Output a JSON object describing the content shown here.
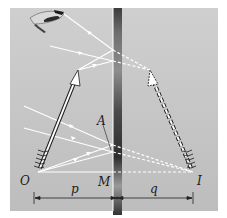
{
  "figure": {
    "labels": {
      "object": "O",
      "image": "I",
      "mirror_point": "M",
      "reflection_point": "A",
      "object_distance": "p",
      "image_distance": "q"
    },
    "colors": {
      "background": "#c3c3c3",
      "mirror_dark": "#3a3a3a",
      "ray": "#ffffff",
      "text": "#1a1a1a"
    },
    "elements": {
      "object_arrow": "real object (arrow) at O",
      "image_arrow": "virtual image (dashed arrow) at I",
      "eye": "observer eye (top-left)",
      "mirror": "vertical plane mirror"
    }
  }
}
